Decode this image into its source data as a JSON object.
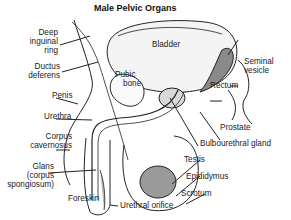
{
  "diagram": {
    "title": "Male Pelvic Organs",
    "colors": {
      "line": "#222222",
      "organ_fill": "#d9d9d9",
      "testis_fill": "#9a9a9a",
      "gland_fill": "#8a8a8a",
      "background": "#ffffff"
    },
    "labels": {
      "deep_inguinal_ring": [
        "Deep",
        "inguinal",
        "ring"
      ],
      "ductus_deferens": [
        "Ductus",
        "deferens"
      ],
      "penis": "Penis",
      "urethra": "Urethra",
      "corpus_cavernosus": [
        "Corpus",
        "cavernosus"
      ],
      "glans": [
        "Glans",
        "(corpus",
        "spongiosum)"
      ],
      "foreskin": "Foreskin",
      "urethral_orifice": "Urethral orifice",
      "bladder": "Bladder",
      "pubic_bone": [
        "Pubic",
        "bone"
      ],
      "seminal_vesicle": [
        "Seminal",
        "vesicle"
      ],
      "rectum": "Rectum",
      "prostate": "Prostate",
      "bulbourethral_gland": "Bulbourethral gland",
      "testis": "Testis",
      "epididymus": "Epididymus",
      "scrotum": "Scrotum"
    }
  }
}
